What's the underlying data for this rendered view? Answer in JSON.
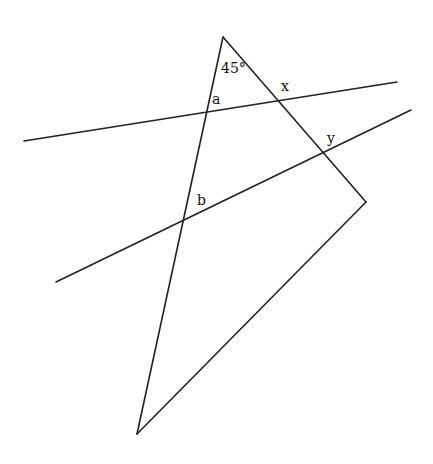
{
  "diagram": {
    "type": "geometry-angles",
    "stroke_color": "#222222",
    "vertices": {
      "top": [
        223,
        37
      ],
      "right": [
        366,
        202
      ],
      "bottom": [
        137,
        434
      ]
    },
    "transversals": [
      {
        "name": "line-upper",
        "from": [
          24,
          141
        ],
        "to": [
          397,
          82
        ]
      },
      {
        "name": "line-lower",
        "from": [
          56,
          282
        ],
        "to": [
          411,
          110
        ]
      }
    ],
    "labels": {
      "angle_top": "45°",
      "a": "a",
      "x": "x",
      "y": "y",
      "b": "b"
    }
  }
}
